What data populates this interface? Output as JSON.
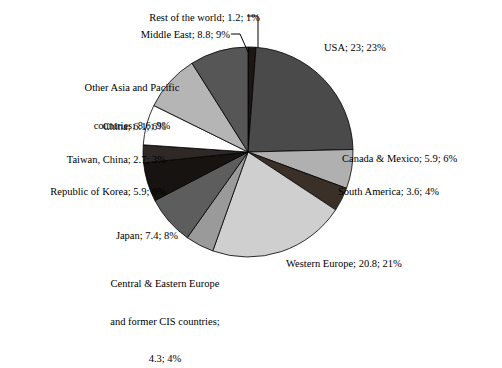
{
  "chart_data": {
    "type": "pie",
    "title": "",
    "legend_position": "none",
    "label_format": "name; value; percent",
    "center": {
      "x": 248,
      "y": 152
    },
    "radius": 105,
    "start_angle_deg": 0,
    "direction": "clockwise",
    "total": 100.3,
    "categories": [
      "Rest of the world",
      "USA",
      "Canada & Mexico",
      "South America",
      "Western Europe",
      "Central & Eastern Europe and former CIS countries",
      "Japan",
      "Republic of Korea",
      "Taiwan, China",
      "China",
      "Other Asia and Pacific countries",
      "Middle East"
    ],
    "values": [
      1.2,
      23,
      5.9,
      3.6,
      20.8,
      4.3,
      7.4,
      5.9,
      2.7,
      6.1,
      8.6,
      8.8
    ],
    "percents": [
      1,
      23,
      6,
      4,
      21,
      4,
      8,
      6,
      3,
      6,
      9,
      9
    ],
    "colors": [
      "#1c1714",
      "#4a4a4a",
      "#b0b0b0",
      "#3a3028",
      "#cfcfcf",
      "#9a9a9a",
      "#5d5d5d",
      "#171310",
      "#2e2926",
      "#ffffff",
      "#b5b5b5",
      "#565656"
    ],
    "slices": [
      {
        "name": "Rest of the world",
        "value": 1.2,
        "percent": 1,
        "color": "#1c1714",
        "label": "Rest of the world; 1.2; 1%"
      },
      {
        "name": "USA",
        "value": 23,
        "percent": 23,
        "color": "#4a4a4a",
        "label": "USA; 23; 23%"
      },
      {
        "name": "Canada & Mexico",
        "value": 5.9,
        "percent": 6,
        "color": "#b0b0b0",
        "label": "Canada & Mexico; 5.9; 6%"
      },
      {
        "name": "South America",
        "value": 3.6,
        "percent": 4,
        "color": "#3a3028",
        "label": "South America; 3.6; 4%"
      },
      {
        "name": "Western Europe",
        "value": 20.8,
        "percent": 21,
        "color": "#cfcfcf",
        "label": "Western Europe; 20.8; 21%"
      },
      {
        "name": "Central & Eastern Europe and former CIS countries",
        "value": 4.3,
        "percent": 4,
        "color": "#9a9a9a",
        "label": "Central & Eastern Europe and former CIS countries; 4.3; 4%"
      },
      {
        "name": "Japan",
        "value": 7.4,
        "percent": 8,
        "color": "#5d5d5d",
        "label": "Japan; 7.4; 8%"
      },
      {
        "name": "Republic of Korea",
        "value": 5.9,
        "percent": 6,
        "color": "#171310",
        "label": "Republic of Korea; 5.9; 6%"
      },
      {
        "name": "Taiwan, China",
        "value": 2.7,
        "percent": 3,
        "color": "#2e2926",
        "label": "Taiwan, China; 2.7; 3%"
      },
      {
        "name": "China",
        "value": 6.1,
        "percent": 6,
        "color": "#ffffff",
        "label": "China; 6.1; 6%"
      },
      {
        "name": "Other Asia and Pacific countries",
        "value": 8.6,
        "percent": 9,
        "color": "#b5b5b5",
        "label": "Other Asia and Pacific countries; 8.6; 9%"
      },
      {
        "name": "Middle East",
        "value": 8.8,
        "percent": 9,
        "color": "#565656",
        "label": "Middle East; 8.8; 9%"
      }
    ]
  },
  "labels": {
    "rest_of_world": "Rest of the world; 1.2; 1%",
    "middle_east": "Middle East; 8.8; 9%",
    "other_asia_line1": "Other Asia and Pacific",
    "other_asia_line2": "countries; 8.6; 9%",
    "china": "China; 6.1; 6%",
    "taiwan": "Taiwan, China; 2.7; 3%",
    "korea": "Republic of Korea; 5.9; 6%",
    "japan": "Japan; 7.4; 8%",
    "cis_line1": "Central & Eastern Europe",
    "cis_line2": "and former CIS countries;",
    "cis_line3": "4.3; 4%",
    "usa": "USA; 23; 23%",
    "canada_mexico": "Canada & Mexico; 5.9; 6%",
    "south_america": "South America; 3.6; 4%",
    "western_europe": "Western Europe; 20.8; 21%"
  }
}
